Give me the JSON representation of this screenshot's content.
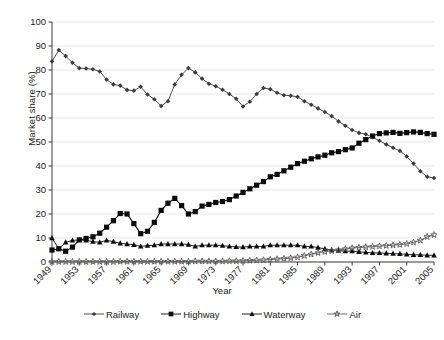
{
  "chart_data": {
    "type": "line",
    "title": "",
    "xlabel": "Year",
    "ylabel": "Market share (%)",
    "ylim": [
      0,
      100
    ],
    "ytick_step": 10,
    "yticks": [
      0,
      10,
      20,
      30,
      40,
      50,
      60,
      70,
      80,
      90,
      100
    ],
    "xlim": [
      1949,
      2005
    ],
    "xticks": [
      1949,
      1953,
      1957,
      1961,
      1965,
      1969,
      1973,
      1977,
      1981,
      1985,
      1989,
      1993,
      1997,
      2001,
      2005
    ],
    "xtick_labels": [
      "1949",
      "1953",
      "1957",
      "1961",
      "1965",
      "1969",
      "1973",
      "1977",
      "1981",
      "1985",
      "1989",
      "1993",
      "1997",
      "2001",
      "2005"
    ],
    "xtick_rotation": -45,
    "grid": "horizontal",
    "legend_position": "bottom",
    "x": [
      1949,
      1950,
      1951,
      1952,
      1953,
      1954,
      1955,
      1956,
      1957,
      1958,
      1959,
      1960,
      1961,
      1962,
      1963,
      1964,
      1965,
      1966,
      1967,
      1968,
      1969,
      1970,
      1971,
      1972,
      1973,
      1974,
      1975,
      1976,
      1977,
      1978,
      1979,
      1980,
      1981,
      1982,
      1983,
      1984,
      1985,
      1986,
      1987,
      1988,
      1989,
      1990,
      1991,
      1992,
      1993,
      1994,
      1995,
      1996,
      1997,
      1998,
      1999,
      2000,
      2001,
      2002,
      2003,
      2004,
      2005
    ],
    "series": [
      {
        "name": "Railway",
        "marker": "diamond",
        "color": "#3a3a3a",
        "values": [
          83.6,
          88.3,
          85.8,
          83.0,
          80.8,
          80.6,
          80.3,
          79.4,
          76.0,
          74.0,
          73.5,
          71.7,
          71.4,
          73.0,
          69.8,
          67.8,
          65.0,
          67.0,
          74.0,
          78.0,
          80.8,
          79.0,
          76.4,
          74.3,
          73.2,
          71.8,
          70.0,
          68.0,
          64.8,
          66.8,
          70.0,
          72.5,
          72.0,
          70.5,
          69.5,
          69.3,
          68.8,
          67.0,
          65.5,
          64.0,
          62.5,
          60.8,
          58.6,
          56.8,
          55.0,
          53.8,
          53.2,
          52.0,
          50.5,
          49.0,
          47.6,
          46.3,
          44.0,
          41.0,
          37.8,
          35.5,
          35.0
        ]
      },
      {
        "name": "Highway",
        "marker": "square",
        "color": "#0a0a0a",
        "values": [
          5.0,
          5.5,
          4.5,
          6.2,
          9.2,
          9.8,
          10.5,
          12.0,
          14.5,
          17.2,
          20.2,
          20.0,
          16.0,
          11.8,
          12.8,
          16.5,
          21.5,
          24.5,
          26.5,
          23.5,
          20.0,
          21.0,
          23.3,
          24.0,
          24.8,
          25.2,
          26.0,
          27.5,
          29.0,
          30.5,
          32.0,
          33.5,
          35.5,
          36.5,
          38.0,
          39.5,
          41.0,
          42.0,
          43.0,
          43.8,
          44.5,
          45.5,
          46.0,
          46.8,
          47.5,
          49.5,
          51.0,
          52.5,
          53.5,
          53.8,
          54.0,
          53.6,
          53.9,
          54.2,
          54.0,
          53.5,
          53.2
        ]
      },
      {
        "name": "Waterway",
        "marker": "triangle",
        "color": "#0a0a0a",
        "values": [
          10.0,
          5.5,
          8.2,
          9.0,
          9.2,
          9.0,
          8.5,
          8.2,
          9.0,
          8.5,
          7.8,
          7.5,
          7.2,
          6.5,
          6.8,
          7.0,
          7.5,
          7.5,
          7.5,
          7.5,
          7.3,
          6.5,
          7.0,
          7.0,
          7.0,
          6.8,
          6.5,
          6.3,
          6.2,
          6.5,
          6.5,
          6.5,
          7.0,
          7.0,
          7.0,
          7.0,
          7.0,
          6.5,
          6.5,
          6.0,
          5.5,
          5.0,
          4.8,
          4.5,
          4.5,
          4.2,
          4.0,
          3.8,
          3.8,
          3.6,
          3.5,
          3.4,
          3.2,
          3.0,
          3.0,
          2.8,
          2.8
        ]
      },
      {
        "name": "Air",
        "marker": "star",
        "color": "#5a5a5a",
        "values": [
          0.1,
          0.1,
          0.1,
          0.1,
          0.1,
          0.1,
          0.1,
          0.1,
          0.1,
          0.1,
          0.2,
          0.2,
          0.2,
          0.2,
          0.2,
          0.2,
          0.2,
          0.2,
          0.2,
          0.2,
          0.2,
          0.3,
          0.3,
          0.3,
          0.3,
          0.3,
          0.4,
          0.4,
          0.5,
          0.6,
          0.7,
          0.8,
          1.0,
          1.2,
          1.4,
          1.6,
          2.0,
          2.6,
          3.2,
          3.8,
          4.3,
          4.6,
          5.0,
          5.4,
          5.8,
          6.0,
          6.2,
          6.4,
          6.6,
          6.8,
          7.0,
          7.2,
          7.6,
          8.2,
          9.0,
          10.5,
          11.3
        ]
      }
    ]
  },
  "legend": {
    "items": [
      {
        "label": "Railway"
      },
      {
        "label": "Highway"
      },
      {
        "label": "Waterway"
      },
      {
        "label": "Air"
      }
    ]
  },
  "axes": {
    "y_title": "Market share (%)",
    "x_title": "Year"
  }
}
